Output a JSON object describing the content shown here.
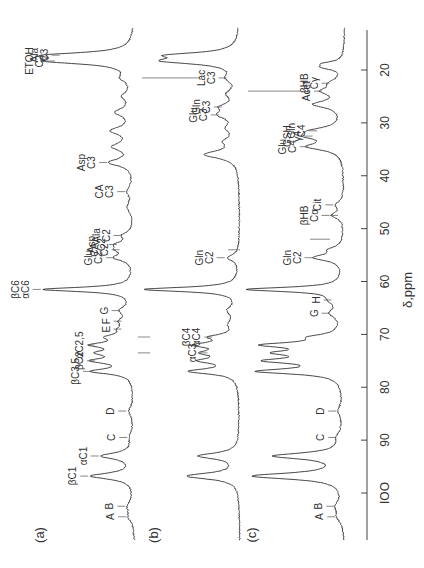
{
  "figure": {
    "axis_label": "δ,ppm",
    "panels": [
      {
        "id": "a",
        "label": "(a)"
      },
      {
        "id": "b",
        "label": "(b)"
      },
      {
        "id": "c",
        "label": "(c)"
      }
    ],
    "orientation": "rotated-90-ccw"
  },
  "chart_data": {
    "type": "line",
    "title": "",
    "xlabel": "δ,ppm",
    "ylabel": "",
    "x_axis": {
      "ticks": [
        20,
        30,
        40,
        50,
        60,
        70,
        80,
        90,
        100
      ],
      "tick_labels": [
        "20",
        "30",
        "40",
        "50",
        "60",
        "70",
        "80",
        "90",
        "IOO"
      ],
      "range": [
        12,
        108
      ],
      "reversed": true
    },
    "grid": false,
    "legend": null,
    "series": [
      {
        "name": "(a)",
        "peaks": [
          {
            "ppm": 104.5,
            "h": 0.05,
            "w": 1.2,
            "label": "A"
          },
          {
            "ppm": 102.5,
            "h": 0.06,
            "w": 1.2,
            "label": "B"
          },
          {
            "ppm": 96.8,
            "h": 0.45,
            "w": 0.7,
            "label": "βC1"
          },
          {
            "ppm": 93.0,
            "h": 0.34,
            "w": 0.7,
            "label": "αC1"
          },
          {
            "ppm": 89.5,
            "h": 0.04,
            "w": 1.2,
            "label": "C"
          },
          {
            "ppm": 84.5,
            "h": 0.05,
            "w": 1.2,
            "label": "D"
          },
          {
            "ppm": 77.0,
            "h": 0.42,
            "w": 0.6,
            "label": "βC3,5"
          },
          {
            "ppm": 75.0,
            "h": 0.38,
            "w": 0.6,
            "label": "βC2"
          },
          {
            "ppm": 73.5,
            "h": 0.3,
            "w": 0.6,
            "label": "αC3"
          },
          {
            "ppm": 72.0,
            "h": 0.38,
            "w": 0.6,
            "label": "αC2,5"
          },
          {
            "ppm": 70.5,
            "h": 0.22,
            "w": 0.6,
            "label": "αC4,βC4"
          },
          {
            "ppm": 69.0,
            "h": 0.1,
            "w": 0.8,
            "label": "E"
          },
          {
            "ppm": 67.5,
            "h": 0.1,
            "w": 0.8,
            "label": "F"
          },
          {
            "ppm": 65.5,
            "h": 0.12,
            "w": 1.0,
            "label": "G"
          },
          {
            "ppm": 61.5,
            "h": 0.95,
            "w": 0.5,
            "label": "βC6 αC6"
          },
          {
            "ppm": 55.5,
            "h": 0.18,
            "w": 0.7,
            "label": "Glu C2"
          },
          {
            "ppm": 54.0,
            "h": 0.12,
            "w": 0.7,
            "label": "CA C2"
          },
          {
            "ppm": 53.0,
            "h": 0.15,
            "w": 0.7,
            "label": "Asp C2"
          },
          {
            "ppm": 51.3,
            "h": 0.1,
            "w": 0.7,
            "label": "Ala C2"
          },
          {
            "ppm": 46.0,
            "h": 0.06,
            "w": 1.2,
            "label": ""
          },
          {
            "ppm": 43.0,
            "h": 0.06,
            "w": 1.2,
            "label": "CA C3"
          },
          {
            "ppm": 37.5,
            "h": 0.25,
            "w": 0.8,
            "label": "Asp C3"
          },
          {
            "ppm": 34.5,
            "h": 0.2,
            "w": 0.9,
            "label": ""
          },
          {
            "ppm": 31.5,
            "h": 0.22,
            "w": 0.9,
            "label": ""
          },
          {
            "ppm": 28.0,
            "h": 0.18,
            "w": 0.9,
            "label": ""
          },
          {
            "ppm": 25.0,
            "h": 0.1,
            "w": 0.9,
            "label": ""
          },
          {
            "ppm": 21.5,
            "h": 0.1,
            "w": 0.9,
            "label": ""
          },
          {
            "ppm": 18.3,
            "h": 0.8,
            "w": 0.7,
            "label": "ETOH C2"
          },
          {
            "ppm": 17.2,
            "h": 0.75,
            "w": 0.6,
            "label": "Ala C3"
          }
        ]
      },
      {
        "name": "(b)",
        "peaks": [
          {
            "ppm": 96.8,
            "h": 0.55,
            "w": 0.7,
            "label": ""
          },
          {
            "ppm": 93.0,
            "h": 0.42,
            "w": 0.7,
            "label": ""
          },
          {
            "ppm": 77.0,
            "h": 0.5,
            "w": 0.6,
            "label": ""
          },
          {
            "ppm": 75.0,
            "h": 0.35,
            "w": 0.6,
            "label": ""
          },
          {
            "ppm": 73.5,
            "h": 0.3,
            "w": 0.6,
            "label": "αC3"
          },
          {
            "ppm": 72.0,
            "h": 0.4,
            "w": 0.6,
            "label": ""
          },
          {
            "ppm": 70.5,
            "h": 0.25,
            "w": 0.6,
            "label": "βC4 αC4"
          },
          {
            "ppm": 68.0,
            "h": 0.08,
            "w": 1.0,
            "label": ""
          },
          {
            "ppm": 65.5,
            "h": 0.1,
            "w": 1.0,
            "label": ""
          },
          {
            "ppm": 61.5,
            "h": 1.0,
            "w": 0.5,
            "label": ""
          },
          {
            "ppm": 55.5,
            "h": 0.12,
            "w": 0.7,
            "label": "Gln C2"
          },
          {
            "ppm": 36.0,
            "h": 0.35,
            "w": 0.9,
            "label": ""
          },
          {
            "ppm": 33.5,
            "h": 0.12,
            "w": 0.9,
            "label": ""
          },
          {
            "ppm": 31.0,
            "h": 0.1,
            "w": 0.9,
            "label": ""
          },
          {
            "ppm": 28.5,
            "h": 0.18,
            "w": 0.9,
            "label": "Glu C3"
          },
          {
            "ppm": 27.0,
            "h": 0.15,
            "w": 0.8,
            "label": "Gln C3"
          },
          {
            "ppm": 24.5,
            "h": 0.1,
            "w": 0.9,
            "label": ""
          },
          {
            "ppm": 21.5,
            "h": 0.1,
            "w": 0.9,
            "label": "Lac C3"
          },
          {
            "ppm": 18.3,
            "h": 0.7,
            "w": 0.7,
            "label": ""
          },
          {
            "ppm": 17.2,
            "h": 0.6,
            "w": 0.6,
            "label": ""
          }
        ]
      },
      {
        "name": "(c)",
        "peaks": [
          {
            "ppm": 104.5,
            "h": 0.06,
            "w": 1.2,
            "label": "A"
          },
          {
            "ppm": 102.5,
            "h": 0.07,
            "w": 1.2,
            "label": "B"
          },
          {
            "ppm": 96.8,
            "h": 0.95,
            "w": 0.7,
            "label": ""
          },
          {
            "ppm": 93.0,
            "h": 0.72,
            "w": 0.7,
            "label": ""
          },
          {
            "ppm": 89.5,
            "h": 0.05,
            "w": 1.2,
            "label": "C"
          },
          {
            "ppm": 84.5,
            "h": 0.05,
            "w": 1.2,
            "label": "D"
          },
          {
            "ppm": 77.0,
            "h": 0.85,
            "w": 0.6,
            "label": ""
          },
          {
            "ppm": 75.0,
            "h": 0.7,
            "w": 0.6,
            "label": ""
          },
          {
            "ppm": 73.5,
            "h": 0.55,
            "w": 0.6,
            "label": ""
          },
          {
            "ppm": 72.0,
            "h": 0.75,
            "w": 0.6,
            "label": ""
          },
          {
            "ppm": 70.5,
            "h": 0.25,
            "w": 0.6,
            "label": ""
          },
          {
            "ppm": 66.0,
            "h": 0.12,
            "w": 1.0,
            "label": "G"
          },
          {
            "ppm": 63.5,
            "h": 0.1,
            "w": 1.0,
            "label": "H"
          },
          {
            "ppm": 61.5,
            "h": 1.0,
            "w": 0.5,
            "label": ""
          },
          {
            "ppm": 55.5,
            "h": 0.3,
            "w": 0.7,
            "label": "Gln C2"
          },
          {
            "ppm": 54.0,
            "h": 0.12,
            "w": 0.7,
            "label": ""
          },
          {
            "ppm": 47.5,
            "h": 0.12,
            "w": 0.7,
            "label": "βHB Cα"
          },
          {
            "ppm": 45.5,
            "h": 0.08,
            "w": 0.8,
            "label": "Cit"
          },
          {
            "ppm": 34.5,
            "h": 0.35,
            "w": 0.8,
            "label": "Glu C4"
          },
          {
            "ppm": 32.5,
            "h": 0.3,
            "w": 0.8,
            "label": "GSH γ4"
          },
          {
            "ppm": 31.5,
            "h": 0.25,
            "w": 0.8,
            "label": "Gln C4"
          },
          {
            "ppm": 26.5,
            "h": 0.3,
            "w": 0.8,
            "label": ""
          },
          {
            "ppm": 24.0,
            "h": 0.2,
            "w": 0.8,
            "label": "Acet"
          },
          {
            "ppm": 22.5,
            "h": 0.12,
            "w": 0.8,
            "label": "βHB Cγ"
          },
          {
            "ppm": 19.5,
            "h": 0.18,
            "w": 0.5,
            "label": ""
          },
          {
            "ppm": 18.8,
            "h": 0.18,
            "w": 0.5,
            "label": ""
          }
        ]
      }
    ],
    "annotations": [
      {
        "panel": "a",
        "text": "A",
        "ppm": 104.5
      },
      {
        "panel": "a",
        "text": "B",
        "ppm": 102.5
      },
      {
        "panel": "a",
        "text": "βC1",
        "ppm": 96.8
      },
      {
        "panel": "a",
        "text": "αC1",
        "ppm": 93.0
      },
      {
        "panel": "a",
        "text": "C",
        "ppm": 89.5
      },
      {
        "panel": "a",
        "text": "D",
        "ppm": 84.5
      },
      {
        "panel": "a",
        "text": "βC3,5",
        "ppm": 77.0
      },
      {
        "panel": "a",
        "text": "βC2",
        "ppm": 75.0
      },
      {
        "panel": "a",
        "text": "αC2,5",
        "ppm": 72.0
      },
      {
        "panel": "a",
        "text": "E",
        "ppm": 69.0
      },
      {
        "panel": "a",
        "text": "F",
        "ppm": 67.5
      },
      {
        "panel": "a",
        "text": "G",
        "ppm": 65.5
      },
      {
        "panel": "a",
        "text": "βC6 αC6",
        "ppm": 61.5
      },
      {
        "panel": "a",
        "text": "Glu C2",
        "ppm": 55.5
      },
      {
        "panel": "a",
        "text": "CA C2",
        "ppm": 54.0
      },
      {
        "panel": "a",
        "text": "Asp C2",
        "ppm": 53.0
      },
      {
        "panel": "a",
        "text": "Ala C2",
        "ppm": 51.3
      },
      {
        "panel": "a",
        "text": "CA C3",
        "ppm": 43.0
      },
      {
        "panel": "a",
        "text": "Asp C3",
        "ppm": 37.5
      },
      {
        "panel": "a",
        "text": "ETOH C2",
        "ppm": 18.3
      },
      {
        "panel": "a",
        "text": "Ala C3",
        "ppm": 17.2
      },
      {
        "panel": "b",
        "text": "αC3",
        "ppm": 73.5
      },
      {
        "panel": "b",
        "text": "βC4 αC4",
        "ppm": 70.5
      },
      {
        "panel": "b",
        "text": "Gln C2",
        "ppm": 55.5
      },
      {
        "panel": "b",
        "text": "Glu C3",
        "ppm": 28.5
      },
      {
        "panel": "b",
        "text": "Gln C3",
        "ppm": 27.0
      },
      {
        "panel": "b",
        "text": "Lac C3",
        "ppm": 21.5
      },
      {
        "panel": "c",
        "text": "A",
        "ppm": 104.5
      },
      {
        "panel": "c",
        "text": "B",
        "ppm": 102.5
      },
      {
        "panel": "c",
        "text": "C",
        "ppm": 89.5
      },
      {
        "panel": "c",
        "text": "D",
        "ppm": 84.5
      },
      {
        "panel": "c",
        "text": "G",
        "ppm": 66.0
      },
      {
        "panel": "c",
        "text": "H",
        "ppm": 63.5
      },
      {
        "panel": "c",
        "text": "Gln C2",
        "ppm": 55.5
      },
      {
        "panel": "c",
        "text": "βHB Cα",
        "ppm": 47.5
      },
      {
        "panel": "c",
        "text": "Cit",
        "ppm": 45.5
      },
      {
        "panel": "c",
        "text": "Glu C4",
        "ppm": 34.5
      },
      {
        "panel": "c",
        "text": "GSH γ4",
        "ppm": 32.5
      },
      {
        "panel": "c",
        "text": "Gln C4",
        "ppm": 31.5
      },
      {
        "panel": "c",
        "text": "Acet",
        "ppm": 24.0
      },
      {
        "panel": "c",
        "text": "βHB Cγ",
        "ppm": 22.5
      }
    ]
  }
}
